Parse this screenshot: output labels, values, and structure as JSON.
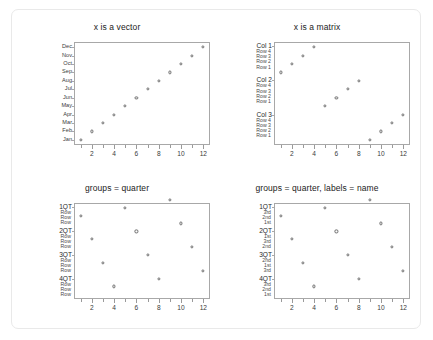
{
  "page": {
    "background": "#ffffff",
    "border_color": "#e9e9e9",
    "frame_color": "#a8a8a8",
    "point_color": "#6e6e6e"
  },
  "chart_data": [
    {
      "id": "x-is-a-vector",
      "type": "scatter",
      "title": "x is a vector",
      "xlabel": "",
      "ylabel": "",
      "xlim": [
        0.4,
        12.6
      ],
      "ylim": [
        0.4,
        12.6
      ],
      "grid": false,
      "legend": null,
      "xticks": [
        2,
        4,
        6,
        8,
        10,
        12
      ],
      "xticks_minor": [
        1,
        3,
        5,
        7,
        9,
        11
      ],
      "ycategories": [
        "Jan",
        "Feb",
        "Mar",
        "Apr",
        "May",
        "Jun",
        "Jul",
        "Aug",
        "Sep",
        "Oct",
        "Nov",
        "Dec"
      ],
      "ylabels_top_to_bottom": [
        "Dec",
        "Nov",
        "Oct",
        "Sep",
        "Aug",
        "Jul",
        "Jun",
        "May",
        "Apr",
        "Mar",
        "Feb",
        "Jan"
      ],
      "x": [
        1,
        2,
        3,
        4,
        5,
        6,
        7,
        8,
        9,
        10,
        11,
        12
      ],
      "y": [
        1,
        2,
        3,
        4,
        5,
        6,
        7,
        8,
        9,
        10,
        11,
        12
      ]
    },
    {
      "id": "x-is-a-matrix",
      "type": "scatter",
      "title": "x is a matrix",
      "xlabel": "",
      "ylabel": "",
      "xlim": [
        0.4,
        12.6
      ],
      "ylim": [
        0.4,
        12.6
      ],
      "grid": false,
      "legend": null,
      "xticks": [
        2,
        4,
        6,
        8,
        10,
        12
      ],
      "xticks_minor": [
        1,
        3,
        5,
        7,
        9,
        11
      ],
      "ygroups": [
        {
          "head": "Col 1",
          "items": [
            "Row 4",
            "Row 3",
            "Row 2",
            "Row 1"
          ]
        },
        {
          "head": "Col 2",
          "items": [
            "Row 4",
            "Row 3",
            "Row 2",
            "Row 1"
          ]
        },
        {
          "head": "Col 3",
          "items": [
            "Row 4",
            "Row 3",
            "Row 2",
            "Row 1"
          ]
        }
      ],
      "x": [
        1,
        2,
        3,
        4,
        5,
        6,
        7,
        8,
        9,
        10,
        11,
        12
      ],
      "y": [
        9,
        10,
        11,
        12,
        5,
        6,
        7,
        8,
        1,
        2,
        3,
        4
      ]
    },
    {
      "id": "groups-quarter",
      "type": "scatter",
      "title": "groups = quarter",
      "xlabel": "",
      "ylabel": "",
      "xlim": [
        0.4,
        12.6
      ],
      "ylim": [
        0.4,
        12.6
      ],
      "grid": false,
      "legend": null,
      "xticks": [
        2,
        4,
        6,
        8,
        10,
        12
      ],
      "xticks_minor": [
        1,
        3,
        5,
        7,
        9,
        11
      ],
      "ygroups": [
        {
          "head": "1QT",
          "items": [
            "Row",
            "Row",
            "Row"
          ]
        },
        {
          "head": "2QT",
          "items": [
            "Row",
            "Row",
            "Row"
          ]
        },
        {
          "head": "3QT",
          "items": [
            "Row",
            "Row",
            "Row"
          ]
        },
        {
          "head": "4QT",
          "items": [
            "Row",
            "Row",
            "Row"
          ]
        }
      ],
      "x": [
        1,
        2,
        3,
        4,
        5,
        6,
        7,
        8,
        9,
        10,
        11,
        12
      ],
      "y": [
        11,
        8,
        5,
        2,
        12,
        9,
        6,
        3,
        13,
        10,
        7,
        4
      ]
    },
    {
      "id": "groups-quarter-labels-name",
      "type": "scatter",
      "title": "groups = quarter, labels = name",
      "xlabel": "",
      "ylabel": "",
      "xlim": [
        0.4,
        12.6
      ],
      "ylim": [
        0.4,
        12.6
      ],
      "grid": false,
      "legend": null,
      "xticks": [
        2,
        4,
        6,
        8,
        10,
        12
      ],
      "xticks_minor": [
        1,
        3,
        5,
        7,
        9,
        11
      ],
      "ygroups": [
        {
          "head": "1QT",
          "items": [
            "3rd",
            "2nd",
            "1st"
          ]
        },
        {
          "head": "2QT",
          "items": [
            "1st",
            "3rd",
            "2nd"
          ]
        },
        {
          "head": "3QT",
          "items": [
            "2nd",
            "1st",
            "3rd"
          ]
        },
        {
          "head": "4QT",
          "items": [
            "3rd",
            "2nd",
            "1st"
          ]
        }
      ],
      "x": [
        1,
        2,
        3,
        4,
        5,
        6,
        7,
        8,
        9,
        10,
        11,
        12
      ],
      "y": [
        11,
        8,
        5,
        2,
        12,
        9,
        6,
        3,
        13,
        10,
        7,
        4
      ]
    }
  ]
}
